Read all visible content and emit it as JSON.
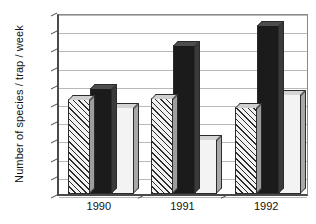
{
  "chart_data": {
    "type": "bar",
    "title": "",
    "subtitle": "",
    "xlabel": "",
    "ylabel": "Number of species / trap / week",
    "categories": [
      "1990",
      "1991",
      "1992"
    ],
    "series": [
      {
        "name": "series-1-hatched",
        "pattern": "diagonal-hatch",
        "color": "#f2f2f2",
        "values": [
          2.6,
          2.65,
          2.4
        ]
      },
      {
        "name": "series-2-black",
        "pattern": "solid",
        "color": "#1b1b1b",
        "values": [
          2.9,
          4.1,
          4.65
        ]
      },
      {
        "name": "series-3-light",
        "pattern": "solid",
        "color": "#f3f3f3",
        "values": [
          2.4,
          1.5,
          2.75
        ]
      }
    ],
    "ylim": [
      0,
      5
    ],
    "ytick_step": 0.5,
    "ytick_labels": [
      "0",
      "0.5",
      "1",
      "1.5",
      "2",
      "2.5",
      "3",
      "3.5",
      "4",
      "4.5",
      "5"
    ],
    "grid": true,
    "grid_axis": "y",
    "legend": false,
    "legend_position": "none",
    "style": "3d-bars",
    "annotations": []
  },
  "axes": {
    "y_title": "Number of species / trap / week"
  }
}
